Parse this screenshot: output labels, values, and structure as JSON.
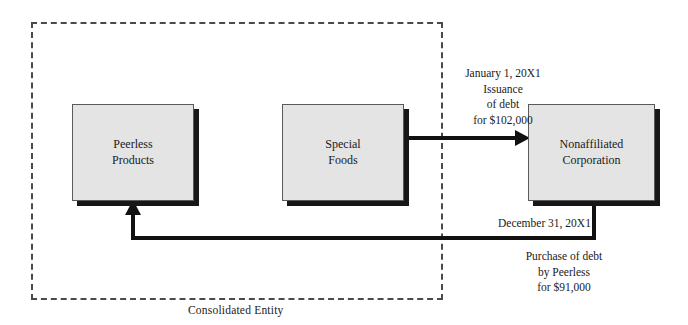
{
  "diagram": {
    "boundary": {
      "caption": "Consolidated Entity",
      "style": "dashed",
      "color": "#4a4a4a"
    },
    "entities": [
      {
        "id": "peerless",
        "label": "Peerless\nProducts",
        "fill": "#e4e4e4",
        "border": "#5a5a5a",
        "shadow": "#171717"
      },
      {
        "id": "special",
        "label": "Special\nFoods",
        "fill": "#e4e4e4",
        "border": "#5a5a5a",
        "shadow": "#171717"
      },
      {
        "id": "nonaffil",
        "label": "Nonaffiliated\nCorporation",
        "fill": "#e4e4e4",
        "border": "#5a5a5a",
        "shadow": "#171717"
      }
    ],
    "flows": [
      {
        "id": "issuance",
        "from": "special",
        "to": "nonaffil",
        "date": "January 1, 20X1",
        "line1": "Issuance",
        "line2": "of debt",
        "line3": "for $102,000",
        "text": "January 1, 20X1\nIssuance\nof debt\nfor $102,000",
        "color": "#111111"
      },
      {
        "id": "purchase",
        "from": "nonaffil",
        "to": "peerless",
        "date": "December 31, 20X1",
        "line1": "Purchase of debt",
        "line2": "by Peerless",
        "line3": "for $91,000",
        "text": "Purchase of debt\nby Peerless\nfor $91,000",
        "color": "#111111"
      }
    ]
  }
}
